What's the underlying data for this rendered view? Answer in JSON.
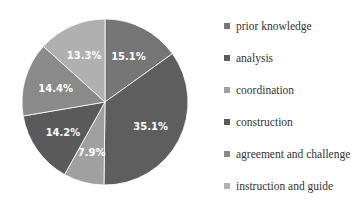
{
  "chart_data": {
    "type": "pie",
    "title": "",
    "categories": [
      "prior knowledge",
      "analysis",
      "coordination",
      "construction",
      "agreement and challenge",
      "instruction and guide"
    ],
    "values": [
      15.1,
      35.1,
      7.9,
      14.2,
      14.4,
      13.3
    ],
    "labels": [
      "15.1%",
      "35.1%",
      "7.9%",
      "14.2%",
      "14.4%",
      "13.3%"
    ],
    "colors": [
      "#767676",
      "#5e5e5e",
      "#a0a0a0",
      "#5a5a5a",
      "#8a8a8a",
      "#b0b0b0"
    ],
    "start_angle": "12 o'clock",
    "direction": "clockwise",
    "legend_position": "right"
  }
}
